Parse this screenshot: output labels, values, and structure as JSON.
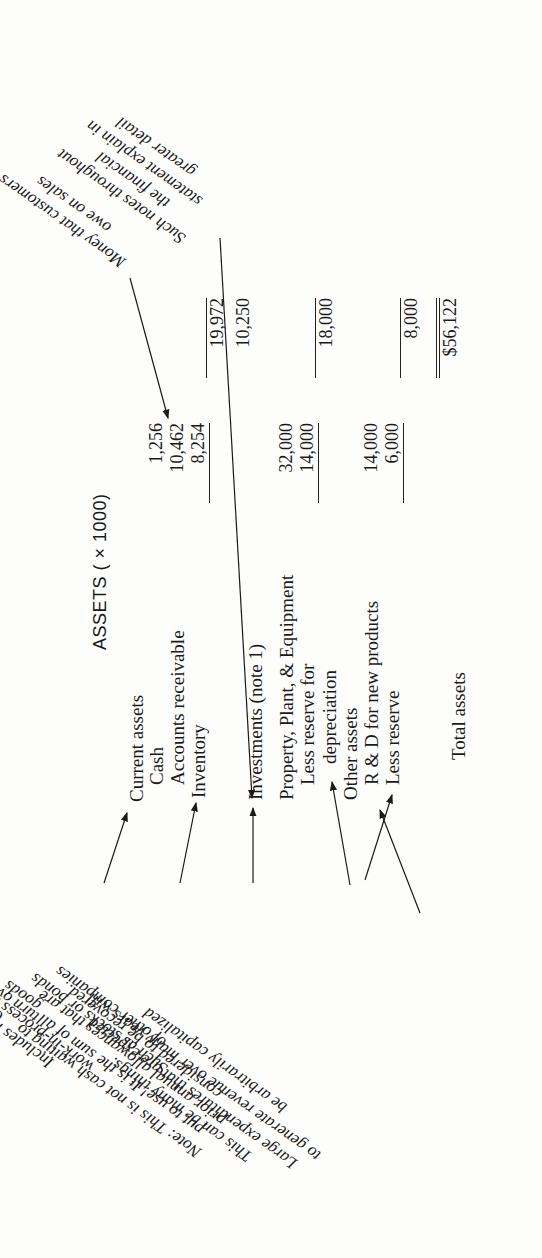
{
  "title": "ASSETS ( × 1000)",
  "rows": [
    {
      "label": "Current assets"
    },
    {
      "label": "Cash",
      "col1": "1,256"
    },
    {
      "label": "Accounts receivable",
      "col1": "10,462"
    },
    {
      "label": "Inventory",
      "col1": "8,254",
      "col2": "19,972"
    },
    {
      "label": "Investments (note 1)",
      "col2": "10,250"
    },
    {
      "label": "Property, Plant, & Equipment",
      "col1": "32,000"
    },
    {
      "label": "Less reserve for",
      "col1": "14,000"
    },
    {
      "label": "depreciation",
      "col2": "18,000"
    },
    {
      "label": "Other assets"
    },
    {
      "label": "R & D for new products",
      "col1": "14,000"
    },
    {
      "label": "Less reserve",
      "col1": "6,000",
      "col2": "8,000"
    },
    {
      "label": "Total assets",
      "col2": "$56,122"
    }
  ],
  "notes": {
    "receivables": [
      "Money that customers",
      "owe on sales"
    ],
    "investments_note": [
      "Such notes throughout",
      "the financial",
      "statement explain in",
      "greater detail"
    ],
    "current_assets": [
      "Current assets",
      "turn over within a year"
    ],
    "inventory": [
      "Includes materials",
      "work-in-process and finished",
      "goods"
    ],
    "investments": [
      "Such as stocks or bonds",
      "of other companies"
    ],
    "depreciation": [
      "Note:  This is not cash waiting to",
      "put to use! It is the sum of all",
      "prior annual allowances that are",
      "considered to be recovered."
    ],
    "other_assets": [
      "This can be many things.",
      "Large expenditures that are expected",
      "to generate revenue over many years will",
      "be arbitrarily capitalized"
    ]
  }
}
